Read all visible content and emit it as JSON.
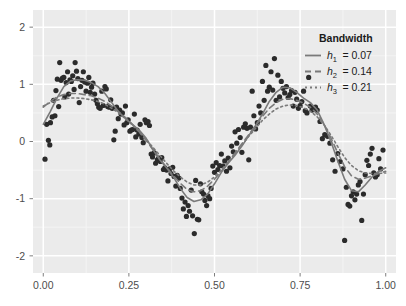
{
  "chart_data": {
    "type": "scatter",
    "title": "",
    "subtitle": "",
    "xlabel": "",
    "ylabel": "",
    "xlim": [
      -0.03,
      1.03
    ],
    "ylim": [
      -2.3,
      2.3
    ],
    "grid": true,
    "panel_background": "#ebebeb",
    "grid_color_major": "#ffffff",
    "grid_color_minor": "#f4f4f4",
    "point_color": "#2b2b2b",
    "point_size": 2.6,
    "curve_color": "#7a7a7a",
    "x_ticks": [
      0.0,
      0.25,
      0.5,
      0.75,
      1.0
    ],
    "x_tick_labels": [
      "0.00",
      "0.25",
      "0.50",
      "0.75",
      "1.00"
    ],
    "y_ticks": [
      2,
      1,
      0,
      -1,
      -2
    ],
    "y_tick_labels": [
      "2",
      "1",
      "0",
      "-1",
      "-2"
    ],
    "legend": {
      "title": "Bandwidth",
      "position": "top-right-inside",
      "entries": [
        {
          "label": "h",
          "sub": "1",
          "value": "= 0.07",
          "dash": "none",
          "bandwidth": 0.07
        },
        {
          "label": "h",
          "sub": "2",
          "value": "= 0.14",
          "dash": "dashed",
          "bandwidth": 0.14
        },
        {
          "label": "h",
          "sub": "3",
          "value": "= 0.21",
          "dash": "dotted",
          "bandwidth": 0.21
        }
      ]
    },
    "series": [
      {
        "name": "observations",
        "type": "scatter",
        "x": [
          0.005,
          0.01,
          0.015,
          0.019,
          0.021,
          0.026,
          0.03,
          0.034,
          0.037,
          0.041,
          0.045,
          0.048,
          0.052,
          0.056,
          0.06,
          0.063,
          0.067,
          0.071,
          0.074,
          0.078,
          0.082,
          0.086,
          0.09,
          0.093,
          0.097,
          0.101,
          0.105,
          0.109,
          0.113,
          0.117,
          0.121,
          0.125,
          0.129,
          0.133,
          0.137,
          0.141,
          0.145,
          0.15,
          0.154,
          0.158,
          0.162,
          0.166,
          0.171,
          0.175,
          0.18,
          0.184,
          0.188,
          0.193,
          0.197,
          0.201,
          0.206,
          0.21,
          0.214,
          0.219,
          0.223,
          0.227,
          0.231,
          0.236,
          0.24,
          0.244,
          0.248,
          0.253,
          0.257,
          0.261,
          0.266,
          0.27,
          0.274,
          0.279,
          0.283,
          0.288,
          0.292,
          0.297,
          0.301,
          0.306,
          0.31,
          0.315,
          0.319,
          0.324,
          0.328,
          0.333,
          0.337,
          0.342,
          0.346,
          0.351,
          0.355,
          0.36,
          0.364,
          0.369,
          0.373,
          0.378,
          0.382,
          0.387,
          0.391,
          0.396,
          0.4,
          0.405,
          0.409,
          0.414,
          0.418,
          0.423,
          0.427,
          0.432,
          0.436,
          0.441,
          0.445,
          0.45,
          0.454,
          0.459,
          0.463,
          0.468,
          0.472,
          0.477,
          0.481,
          0.486,
          0.49,
          0.495,
          0.5,
          0.505,
          0.51,
          0.515,
          0.52,
          0.525,
          0.53,
          0.535,
          0.54,
          0.545,
          0.55,
          0.555,
          0.56,
          0.565,
          0.57,
          0.575,
          0.58,
          0.585,
          0.59,
          0.595,
          0.6,
          0.605,
          0.61,
          0.615,
          0.62,
          0.625,
          0.63,
          0.635,
          0.64,
          0.645,
          0.65,
          0.655,
          0.66,
          0.665,
          0.67,
          0.675,
          0.68,
          0.685,
          0.69,
          0.695,
          0.7,
          0.705,
          0.71,
          0.715,
          0.72,
          0.725,
          0.73,
          0.735,
          0.74,
          0.745,
          0.75,
          0.755,
          0.76,
          0.765,
          0.77,
          0.775,
          0.78,
          0.785,
          0.79,
          0.795,
          0.8,
          0.808,
          0.815,
          0.822,
          0.83,
          0.837,
          0.845,
          0.852,
          0.86,
          0.867,
          0.875,
          0.88,
          0.885,
          0.89,
          0.895,
          0.9,
          0.905,
          0.91,
          0.915,
          0.92,
          0.925,
          0.93,
          0.935,
          0.94,
          0.945,
          0.95,
          0.955,
          0.96,
          0.965,
          0.97,
          0.975,
          0.98,
          0.985,
          0.992
        ],
        "y": [
          -0.31,
          0.3,
          0.02,
          -0.06,
          0.33,
          0.43,
          0.72,
          0.45,
          0.89,
          1.09,
          0.61,
          1.38,
          1.07,
          1.11,
          1.12,
          0.78,
          1.03,
          1.22,
          0.83,
          1.08,
          1.05,
          1.15,
          0.91,
          1.38,
          1.23,
          1.1,
          0.68,
          0.96,
          1.07,
          1.22,
          1.04,
          0.88,
          1.02,
          1.12,
          0.86,
          0.95,
          1.02,
          0.83,
          0.72,
          0.66,
          0.6,
          0.58,
          0.88,
          0.63,
          0.96,
          0.92,
          0.61,
          0.6,
          0.73,
          0.58,
          0.03,
          0.18,
          0.6,
          0.4,
          0.55,
          0.48,
          0.5,
          0.29,
          0.62,
          0.33,
          0.38,
          0.18,
          0.2,
          0.21,
          0.48,
          0.08,
          0.2,
          0.13,
          0.3,
          0.07,
          -0.02,
          0.38,
          0.33,
          0.35,
          0.28,
          -0.22,
          -0.27,
          -0.2,
          -0.38,
          -0.32,
          -0.29,
          -0.35,
          -0.28,
          -0.49,
          -0.46,
          -0.5,
          -0.69,
          -0.48,
          -0.56,
          -0.45,
          -0.61,
          -0.78,
          -0.59,
          -0.64,
          -0.82,
          -0.99,
          -1.18,
          -1.06,
          -1.31,
          -1.12,
          -1.22,
          -0.85,
          -1.3,
          -1.61,
          -0.68,
          -1.36,
          -1.37,
          -0.74,
          -0.88,
          -0.92,
          -1.03,
          -1.12,
          -0.95,
          -1.0,
          -0.82,
          -0.43,
          -0.54,
          -0.37,
          -0.49,
          -0.42,
          -0.22,
          -0.43,
          -0.34,
          -0.52,
          -0.29,
          -0.46,
          -0.08,
          -0.18,
          0.17,
          -0.03,
          0.21,
          0.07,
          -0.19,
          0.25,
          0.31,
          0.23,
          -0.32,
          0.25,
          0.88,
          0.45,
          0.22,
          0.33,
          0.62,
          0.5,
          1.05,
          0.72,
          1.33,
          0.88,
          0.95,
          1.22,
          0.9,
          1.45,
          0.72,
          1.16,
          0.78,
          1.05,
          0.93,
          0.85,
          0.96,
          0.77,
          0.82,
          0.89,
          0.62,
          0.86,
          0.74,
          0.58,
          0.63,
          0.7,
          0.88,
          0.54,
          0.5,
          1.12,
          0.62,
          0.55,
          0.58,
          0.6,
          0.55,
          0.35,
          0.05,
          0.12,
          0.09,
          -0.03,
          -0.32,
          -0.52,
          -0.21,
          -0.35,
          -0.48,
          -1.73,
          -0.8,
          -1.1,
          -1.13,
          -0.95,
          -0.88,
          -1.02,
          -0.92,
          -0.76,
          -0.7,
          -1.38,
          -0.92,
          -0.58,
          -0.33,
          -0.42,
          -0.22,
          -0.12,
          -0.55,
          -0.62,
          -0.58,
          -0.3,
          -0.48,
          -0.15
        ]
      },
      {
        "name": "h1 = 0.07",
        "type": "line",
        "dash": "none",
        "bandwidth": 0.07,
        "x": [
          0.0,
          0.02,
          0.04,
          0.06,
          0.08,
          0.1,
          0.12,
          0.14,
          0.16,
          0.18,
          0.2,
          0.22,
          0.24,
          0.26,
          0.28,
          0.3,
          0.32,
          0.34,
          0.36,
          0.38,
          0.4,
          0.42,
          0.44,
          0.46,
          0.48,
          0.5,
          0.52,
          0.54,
          0.56,
          0.58,
          0.6,
          0.62,
          0.64,
          0.66,
          0.68,
          0.7,
          0.72,
          0.74,
          0.76,
          0.78,
          0.8,
          0.82,
          0.84,
          0.86,
          0.88,
          0.9,
          0.92,
          0.94,
          0.96,
          0.98,
          1.0
        ],
        "y": [
          0.3,
          0.52,
          0.76,
          0.96,
          1.06,
          1.08,
          1.07,
          1.03,
          0.96,
          0.84,
          0.68,
          0.52,
          0.4,
          0.3,
          0.2,
          0.06,
          -0.14,
          -0.32,
          -0.46,
          -0.62,
          -0.82,
          -0.98,
          -1.05,
          -1.02,
          -0.92,
          -0.74,
          -0.54,
          -0.38,
          -0.24,
          -0.08,
          0.1,
          0.28,
          0.48,
          0.7,
          0.86,
          0.95,
          0.94,
          0.86,
          0.76,
          0.68,
          0.55,
          0.3,
          0.0,
          -0.34,
          -0.66,
          -0.86,
          -0.88,
          -0.76,
          -0.62,
          -0.52,
          -0.46
        ]
      },
      {
        "name": "h2 = 0.14",
        "type": "line",
        "dash": "dashed",
        "bandwidth": 0.14,
        "x": [
          0.0,
          0.02,
          0.04,
          0.06,
          0.08,
          0.1,
          0.12,
          0.14,
          0.16,
          0.18,
          0.2,
          0.22,
          0.24,
          0.26,
          0.28,
          0.3,
          0.32,
          0.34,
          0.36,
          0.38,
          0.4,
          0.42,
          0.44,
          0.46,
          0.48,
          0.5,
          0.52,
          0.54,
          0.56,
          0.58,
          0.6,
          0.62,
          0.64,
          0.66,
          0.68,
          0.7,
          0.72,
          0.74,
          0.76,
          0.78,
          0.8,
          0.82,
          0.84,
          0.86,
          0.88,
          0.9,
          0.92,
          0.94,
          0.96,
          0.98,
          1.0
        ],
        "y": [
          0.6,
          0.7,
          0.78,
          0.82,
          0.84,
          0.84,
          0.82,
          0.8,
          0.76,
          0.7,
          0.62,
          0.52,
          0.42,
          0.3,
          0.17,
          0.02,
          -0.14,
          -0.3,
          -0.45,
          -0.6,
          -0.73,
          -0.84,
          -0.88,
          -0.86,
          -0.78,
          -0.66,
          -0.52,
          -0.36,
          -0.2,
          -0.04,
          0.12,
          0.28,
          0.44,
          0.58,
          0.68,
          0.74,
          0.75,
          0.72,
          0.67,
          0.6,
          0.48,
          0.3,
          0.06,
          -0.2,
          -0.44,
          -0.6,
          -0.66,
          -0.64,
          -0.6,
          -0.56,
          -0.52
        ]
      },
      {
        "name": "h3 = 0.21",
        "type": "line",
        "dash": "dotted",
        "bandwidth": 0.21,
        "x": [
          0.0,
          0.02,
          0.04,
          0.06,
          0.08,
          0.1,
          0.12,
          0.14,
          0.16,
          0.18,
          0.2,
          0.22,
          0.24,
          0.26,
          0.28,
          0.3,
          0.32,
          0.34,
          0.36,
          0.38,
          0.4,
          0.42,
          0.44,
          0.46,
          0.48,
          0.5,
          0.52,
          0.54,
          0.56,
          0.58,
          0.6,
          0.62,
          0.64,
          0.66,
          0.68,
          0.7,
          0.72,
          0.74,
          0.76,
          0.78,
          0.8,
          0.82,
          0.84,
          0.86,
          0.88,
          0.9,
          0.92,
          0.94,
          0.96,
          0.98,
          1.0
        ],
        "y": [
          0.62,
          0.68,
          0.72,
          0.75,
          0.76,
          0.76,
          0.75,
          0.73,
          0.7,
          0.65,
          0.58,
          0.5,
          0.4,
          0.29,
          0.17,
          0.04,
          -0.1,
          -0.24,
          -0.38,
          -0.51,
          -0.62,
          -0.71,
          -0.76,
          -0.76,
          -0.71,
          -0.62,
          -0.5,
          -0.36,
          -0.21,
          -0.06,
          0.09,
          0.23,
          0.37,
          0.48,
          0.57,
          0.62,
          0.64,
          0.63,
          0.59,
          0.53,
          0.43,
          0.29,
          0.11,
          -0.09,
          -0.28,
          -0.42,
          -0.51,
          -0.55,
          -0.56,
          -0.56,
          -0.55
        ]
      }
    ]
  }
}
